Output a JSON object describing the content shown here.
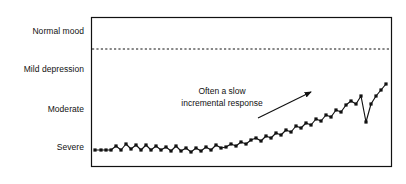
{
  "chart_data": {
    "type": "line",
    "title": "",
    "subtitle": "",
    "xlabel": "",
    "ylabel": "",
    "grid": false,
    "legend": "none",
    "y_category_labels": [
      "Normal mood",
      "Mild depression",
      "Moderate",
      "Severe"
    ],
    "y_category_positions": [
      31,
      69,
      109,
      147
    ],
    "ylim_pixels": [
      17,
      167
    ],
    "xlim_pixels": [
      91,
      392
    ],
    "threshold_line": {
      "label": "",
      "style": "dashed",
      "y_pixel": 49
    },
    "annotations": [
      {
        "text_lines": [
          "Often a slow",
          "incremental response"
        ],
        "x": 222,
        "y_first_line": 92,
        "y_second_line": 104,
        "arrow": {
          "x1": 258,
          "y1": 118,
          "x2": 311,
          "y2": 92
        }
      }
    ],
    "marker": "square",
    "series": [
      {
        "name": "Mood score over time",
        "points_x": [
          95,
          101,
          106,
          111,
          116,
          121,
          126,
          131,
          136,
          141,
          146,
          151,
          156,
          161,
          166,
          171,
          176,
          181,
          186,
          191,
          196,
          201,
          206,
          211,
          216,
          221,
          226,
          231,
          236,
          241,
          246,
          251,
          256,
          261,
          266,
          271,
          276,
          281,
          286,
          291,
          296,
          301,
          306,
          311,
          316,
          321,
          326,
          331,
          336,
          341,
          346,
          351,
          356,
          361,
          366,
          371,
          376,
          381,
          386
        ],
        "points_y": [
          150,
          150,
          150,
          150,
          146,
          150,
          144,
          149,
          145,
          150,
          145,
          150,
          146,
          150,
          147,
          151,
          146,
          151,
          148,
          152,
          148,
          151,
          147,
          150,
          145,
          148,
          147,
          144,
          146,
          142,
          144,
          140,
          138,
          141,
          136,
          138,
          133,
          135,
          130,
          132,
          126,
          128,
          123,
          125,
          119,
          121,
          115,
          117,
          110,
          112,
          105,
          101,
          104,
          96,
          122,
          104,
          96,
          90,
          84
        ]
      }
    ]
  }
}
